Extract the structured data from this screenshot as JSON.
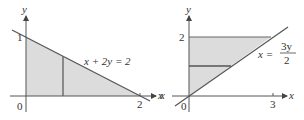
{
  "figures": [
    {
      "id": "left",
      "axis_labels": {
        "x": "x",
        "y": "y"
      },
      "tick_labels": {
        "origin": "0",
        "y_tick": "1",
        "x_tick": "2"
      },
      "curve_label": "x + 2y = 2",
      "region": "triangle under x + 2y = 2 in first quadrant",
      "strip": "vertical"
    },
    {
      "id": "right",
      "axis_labels": {
        "x": "x",
        "y": "y",
        "x_left": "x"
      },
      "tick_labels": {
        "origin": "0",
        "y_tick": "2",
        "x_tick": "3"
      },
      "curve_label_lhs": "x =",
      "curve_label_num": "3y",
      "curve_label_den": "2",
      "region": "region between y-axis, x = 3y/2, and y = 2",
      "strip": "horizontal"
    }
  ],
  "colors": {
    "fill": "#dcdcdc",
    "line": "#555555",
    "strip": "#666666"
  }
}
